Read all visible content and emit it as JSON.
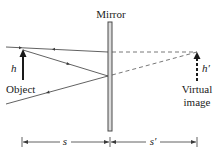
{
  "diagram": {
    "labels": {
      "mirror": "Mirror",
      "object_height": "h",
      "object": "Object",
      "image_height": "h′",
      "virtual_image_line1": "Virtual",
      "virtual_image_line2": "image",
      "object_distance": "s",
      "image_distance": "s′"
    },
    "colors": {
      "line": "#3a3a3a",
      "mirror": "#4a4a4a",
      "mirror_fill": "#dcdcdc",
      "text": "#1a1a1a",
      "background": "#ffffff"
    }
  }
}
